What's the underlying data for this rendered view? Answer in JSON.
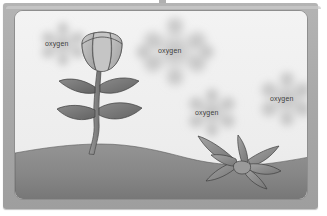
{
  "scene": {
    "title": "photosynthesis-oxygen-release-diagram",
    "background_sky_color": "#efefef",
    "ground_color": "#8d8d8d",
    "frame_color": "#aaaaaa",
    "outline_color": "#3c3c3c",
    "label_text_color": "#3a3a3a"
  },
  "labels": {
    "oxygen": "oxygen"
  },
  "oxygen_clouds": [
    {
      "id": "cloud-top-left",
      "label": "oxygen",
      "x": 30,
      "y": 29,
      "cloud_cx": 48,
      "cloud_cy": 33,
      "cloud_r": 26
    },
    {
      "id": "cloud-top-center",
      "label": "oxygen",
      "x": 143,
      "y": 36,
      "cloud_cx": 160,
      "cloud_cy": 40,
      "cloud_r": 36
    },
    {
      "id": "cloud-mid-center",
      "label": "oxygen",
      "x": 180,
      "y": 98,
      "cloud_cx": 197,
      "cloud_cy": 101,
      "cloud_r": 28
    },
    {
      "id": "cloud-mid-right",
      "label": "oxygen",
      "x": 255,
      "y": 84,
      "cloud_cx": 272,
      "cloud_cy": 88,
      "cloud_r": 31
    }
  ],
  "plants": [
    {
      "id": "flowering-plant",
      "name": "tulip-bud-plant",
      "position": "left",
      "parts": [
        "flower-bud",
        "stem",
        "leaf-upper-left",
        "leaf-upper-right",
        "leaf-lower-left",
        "leaf-lower-right"
      ],
      "leaf_count": 4,
      "flower_color": "#bdbdbd",
      "leaf_color": "#757575",
      "stem_color": "#8a8a8a"
    },
    {
      "id": "grass-plant",
      "name": "spiky-grass-plant",
      "position": "right",
      "parts": [
        "blade-1",
        "blade-2",
        "blade-3",
        "blade-4",
        "blade-5",
        "blade-6",
        "blade-7"
      ],
      "leaf_count": 7,
      "leaf_color": "#8b8b8b"
    }
  ],
  "ground": {
    "id": "soil-mound",
    "horizon_description": "wavy hill horizon, higher on left, dipping right",
    "fill_top": "#8f8f8f",
    "fill_bottom": "#7c7c7c"
  },
  "top_mark": {
    "id": "top-edge-mark",
    "visible": true
  }
}
